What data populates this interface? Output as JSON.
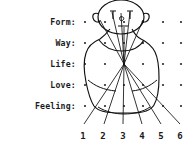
{
  "figure": {
    "ink_color": "#111111",
    "dot_color": "#2b2b2b",
    "background_color": "#ffffff"
  },
  "row_labels": [
    {
      "text": "Form:",
      "y": 22
    },
    {
      "text": "Way:",
      "y": 43
    },
    {
      "text": "Life:",
      "y": 64
    },
    {
      "text": "Love:",
      "y": 85
    },
    {
      "text": "Feeling:",
      "y": 106
    }
  ],
  "column_labels": [
    {
      "text": "1",
      "x": 83
    },
    {
      "text": "2",
      "x": 103
    },
    {
      "text": "3",
      "x": 123
    },
    {
      "text": "4",
      "x": 142
    },
    {
      "text": "5",
      "x": 161
    },
    {
      "text": "6",
      "x": 180
    }
  ],
  "grid": {
    "rows": 5,
    "columns": 6,
    "row_y": [
      22,
      43,
      64,
      85,
      106
    ],
    "column_x": [
      85,
      105,
      124,
      143,
      163,
      181
    ],
    "dot_radius": 1.1
  },
  "convergence_point": {
    "x": 124,
    "y": 64
  },
  "leader_lines": [
    {
      "index": 1,
      "from_x": 124,
      "from_y": 64,
      "to_x": 84,
      "to_y": 124
    },
    {
      "index": 2,
      "from_x": 124,
      "from_y": 64,
      "to_x": 104,
      "to_y": 124
    },
    {
      "index": 3,
      "from_x": 124,
      "from_y": 64,
      "to_x": 123,
      "to_y": 124
    },
    {
      "index": 4,
      "from_x": 124,
      "from_y": 64,
      "to_x": 142,
      "to_y": 124
    },
    {
      "index": 5,
      "from_x": 124,
      "from_y": 64,
      "to_x": 161,
      "to_y": 124
    },
    {
      "index": 6,
      "from_x": 124,
      "from_y": 64,
      "to_x": 180,
      "to_y": 124
    }
  ],
  "head_features": {
    "eyes": 2,
    "ears": 2,
    "nose": 1
  }
}
